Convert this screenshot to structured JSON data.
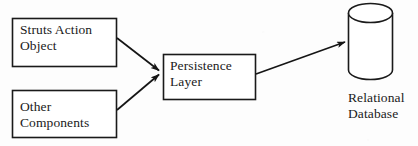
{
  "figure": {
    "background_color": "#fdfdfd",
    "stroke_color": "#1a1a1a",
    "text_color": "#1a1a1a"
  },
  "nodes": [
    {
      "id": "struts-action-object",
      "shape": "rectangle",
      "label": "Struts Action\nObject",
      "x": 12,
      "y": 18,
      "width": 105,
      "height": 49
    },
    {
      "id": "other-components",
      "shape": "rectangle",
      "label": "Other\nComponents",
      "x": 12,
      "y": 90,
      "width": 105,
      "height": 48
    },
    {
      "id": "persistence-layer",
      "shape": "rectangle",
      "label": "Persistence\nLayer",
      "x": 163,
      "y": 54,
      "width": 93,
      "height": 46
    },
    {
      "id": "relational-database",
      "shape": "cylinder",
      "label": "Relational\nDatabase",
      "x": 348,
      "y": 4,
      "width": 45,
      "height": 76
    }
  ],
  "edges": [
    {
      "id": "struts-to-persistence",
      "from": "struts-action-object",
      "to": "persistence-layer",
      "arrowhead": "filled-triangle",
      "x1": 117,
      "y1": 38,
      "x2": 160,
      "y2": 71
    },
    {
      "id": "other-to-persistence",
      "from": "other-components",
      "to": "persistence-layer",
      "arrowhead": "filled-triangle",
      "x1": 117,
      "y1": 110,
      "x2": 160,
      "y2": 74
    },
    {
      "id": "persistence-to-database",
      "from": "persistence-layer",
      "to": "relational-database",
      "arrowhead": "filled-triangle",
      "x1": 256,
      "y1": 74,
      "x2": 346,
      "y2": 42
    }
  ],
  "labels": {
    "struts_action_object": "Struts Action\nObject",
    "other_components": "Other\nComponents",
    "persistence_layer": "Persistence\nLayer",
    "relational_database": "Relational\nDatabase"
  }
}
